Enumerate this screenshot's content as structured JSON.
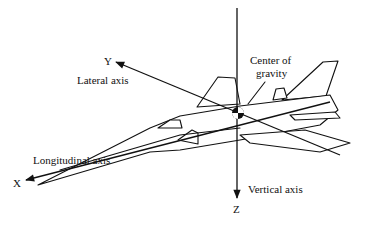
{
  "diagram": {
    "axes": [
      {
        "id": "x",
        "letter": "X",
        "label": "Longitudinal axis"
      },
      {
        "id": "y",
        "letter": "Y",
        "label": "Lateral axis"
      },
      {
        "id": "z",
        "letter": "Z",
        "label": "Vertical axis"
      }
    ],
    "center": {
      "label_line1": "Center of",
      "label_line2": "gravity"
    },
    "colors": {
      "line": "#111111",
      "background": "#ffffff"
    }
  }
}
